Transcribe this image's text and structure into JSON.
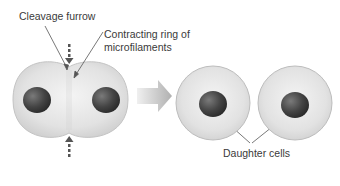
{
  "labels": {
    "cleavage_furrow": "Cleavage furrow",
    "contracting_ring_line1": "Contracting ring of",
    "contracting_ring_line2": "microfilaments",
    "daughter_cells": "Daughter cells"
  },
  "colors": {
    "cell_fill": "#e4e4e4",
    "cell_edge": "#bdbdbd",
    "nucleus": "#4a4a4a",
    "arrow": "#b8b8b8",
    "pointer": "#555555"
  }
}
